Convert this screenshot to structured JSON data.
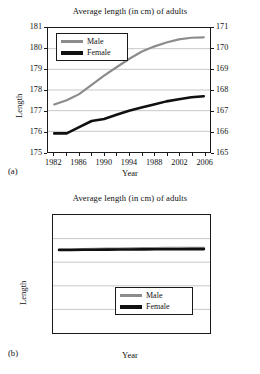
{
  "figure": {
    "panels": [
      {
        "panel_label": "(a)",
        "title": "Average length (in cm) of adults",
        "ylabel": "Length",
        "xlabel": "Year"
      },
      {
        "panel_label": "(b)",
        "title": "Average length (in cm) of adults",
        "ylabel": "Length",
        "xlabel": "Year"
      }
    ]
  },
  "colors": {
    "male_line": "#8c8c8c",
    "female_line": "#101010",
    "axis": "#1a1a1a",
    "grid": "#b9b9b9",
    "background": "#ffffff"
  },
  "chart_data": [
    {
      "type": "line",
      "panel": "(a)",
      "title": "Average length (in cm) of adults",
      "xlabel": "Year",
      "ylabel": "Length",
      "grid": true,
      "legend_position": "top-left",
      "x": [
        1982,
        1984,
        1986,
        1988,
        1990,
        1992,
        1994,
        1996,
        1998,
        2000,
        2002,
        2004,
        2006
      ],
      "xtick_labels": [
        "1982",
        "1986",
        "1990",
        "1994",
        "1988",
        "2002",
        "2006"
      ],
      "xtick_values": [
        1982,
        1986,
        1990,
        1994,
        1998,
        2002,
        2006
      ],
      "xlim": [
        1981,
        2007
      ],
      "ylim": [
        175,
        181
      ],
      "ytick_labels": [
        "175",
        "176",
        "177",
        "178",
        "179",
        "180",
        "181"
      ],
      "ytick_values": [
        175,
        176,
        177,
        178,
        179,
        180,
        181
      ],
      "y2lim": [
        165,
        171
      ],
      "y2tick_labels": [
        "165",
        "166",
        "167",
        "168",
        "169",
        "170",
        "171"
      ],
      "y2tick_values": [
        165,
        166,
        167,
        168,
        169,
        170,
        171
      ],
      "series": [
        {
          "name": "Male",
          "color": "#8c8c8c",
          "values": [
            177.3,
            177.5,
            177.8,
            178.25,
            178.7,
            179.1,
            179.5,
            179.85,
            180.1,
            180.3,
            180.45,
            180.53,
            180.55
          ]
        },
        {
          "name": "Female",
          "color": "#101010",
          "values": [
            175.9,
            175.9,
            176.2,
            176.5,
            176.6,
            176.8,
            177.0,
            177.15,
            177.3,
            177.45,
            177.55,
            177.65,
            177.7
          ]
        }
      ]
    },
    {
      "type": "line",
      "panel": "(b)",
      "title": "Average length (in cm) of adults",
      "xlabel": "Year",
      "ylabel": "Length",
      "grid": true,
      "legend_position": "bottom-right",
      "x": [
        1982,
        1984,
        1986,
        1988,
        1990,
        1992,
        1994,
        1996,
        1998,
        2000,
        2002,
        2004,
        2006
      ],
      "xtick_labels": [
        "1982",
        "1986",
        "1990",
        "1994",
        "1988",
        "2002",
        "2006"
      ],
      "xtick_values": [
        1982,
        1986,
        1990,
        1994,
        1998,
        2002,
        2006
      ],
      "xlim": [
        1981,
        2007
      ],
      "ylim": [
        0,
        250
      ],
      "ytick_labels": [
        "0",
        "50",
        "100",
        "150",
        "",
        "250"
      ],
      "ytick_values": [
        0,
        50,
        100,
        150,
        200,
        250
      ],
      "series": [
        {
          "name": "Male",
          "color": "#8c8c8c",
          "values": [
            177.3,
            177.5,
            177.8,
            178.25,
            178.7,
            179.1,
            179.5,
            179.85,
            180.1,
            180.3,
            180.45,
            180.53,
            180.55
          ]
        },
        {
          "name": "Female",
          "color": "#101010",
          "values": [
            175.9,
            175.9,
            176.2,
            176.5,
            176.6,
            176.8,
            177.0,
            177.15,
            177.3,
            177.45,
            177.55,
            177.65,
            177.7
          ]
        }
      ]
    }
  ],
  "legend": {
    "male_label": "Male",
    "female_label": "Female"
  }
}
